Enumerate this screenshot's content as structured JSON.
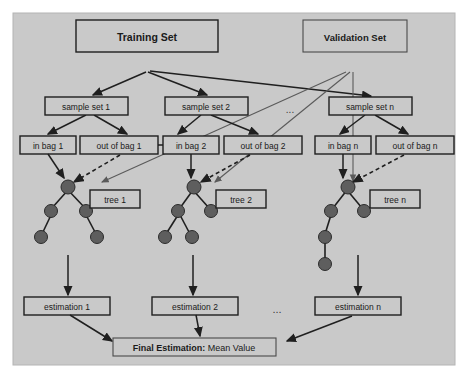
{
  "figure": {
    "background_color": "#ffffff",
    "canvas_color": "#c9c9c9",
    "canvas_border_color": "#b4b4b4",
    "node_fill_color": "#5e5e5e",
    "box_fill_color": "#c9c9c9",
    "box_stroke_color": "#1f1f1f",
    "ellipsis": "..."
  },
  "nodes": {
    "training_set": "Training Set",
    "validation_set": "Validation Set",
    "sample_set_1": "sample set 1",
    "sample_set_2": "sample set 2",
    "sample_set_n": "sample set n",
    "in_bag_1": "in bag 1",
    "out_of_bag_1": "out of bag 1",
    "in_bag_2": "in bag 2",
    "out_of_bag_2": "out of bag  2",
    "in_bag_n": "in bag n",
    "out_of_bag_n": "out of bag n",
    "tree_1": "tree 1",
    "tree_2": "tree 2",
    "tree_n": "tree n",
    "estimation_1": "estimation 1",
    "estimation_2": "estimation 2",
    "estimation_n": "estimation n",
    "final_estimation_bold": "Final Estimation:",
    "final_estimation_rest": " Mean Value"
  }
}
